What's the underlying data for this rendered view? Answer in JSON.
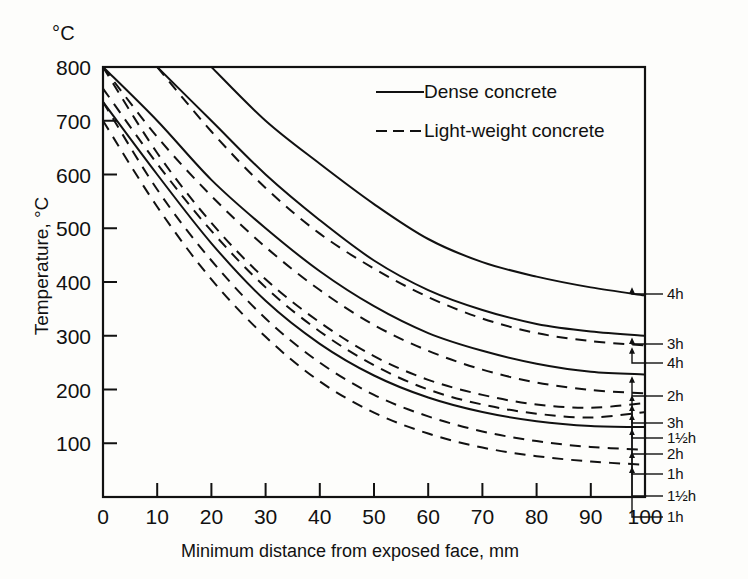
{
  "chart_data": {
    "type": "line",
    "title": "",
    "unit_label": "°C",
    "xlabel": "Minimum distance from exposed face, mm",
    "ylabel": "Temperature, °C",
    "xlim": [
      0,
      100
    ],
    "ylim": [
      0,
      800
    ],
    "xticks": [
      "0",
      "10",
      "20",
      "30",
      "40",
      "50",
      "60",
      "70",
      "80",
      "90",
      "100"
    ],
    "yticks": [
      "100",
      "200",
      "300",
      "400",
      "500",
      "600",
      "700",
      "800"
    ],
    "grid": false,
    "legend_position": "top-right-inside",
    "legend": [
      {
        "label": "Dense concrete",
        "style": "solid"
      },
      {
        "label": "Light-weight concrete",
        "style": "dashed"
      }
    ],
    "x": [
      0,
      10,
      20,
      30,
      40,
      50,
      60,
      70,
      80,
      90,
      100
    ],
    "series": [
      {
        "name": "Dense concrete 4h",
        "style": "solid",
        "end_label": "4h",
        "values": [
          null,
          null,
          800,
          700,
          620,
          545,
          480,
          437,
          410,
          390,
          375
        ]
      },
      {
        "name": "Dense concrete 3h",
        "style": "solid",
        "end_label": "3h",
        "values": [
          null,
          800,
          700,
          600,
          515,
          440,
          385,
          348,
          322,
          308,
          300
        ]
      },
      {
        "name": "Light-weight concrete 4h",
        "style": "dashed",
        "end_label": "4h",
        "values": [
          null,
          800,
          680,
          575,
          490,
          425,
          372,
          332,
          305,
          290,
          282
        ]
      },
      {
        "name": "Dense concrete 2h",
        "style": "solid",
        "end_label": "2h",
        "values": [
          800,
          700,
          590,
          500,
          420,
          355,
          305,
          272,
          248,
          233,
          228
        ]
      },
      {
        "name": "Light-weight concrete 3h",
        "style": "dashed",
        "end_label": "3h",
        "values": [
          800,
          670,
          560,
          465,
          385,
          320,
          272,
          237,
          213,
          199,
          193
        ]
      },
      {
        "name": "Light-weight concrete 1½h",
        "style": "dashed",
        "end_label": "1½h",
        "values": [
          800,
          640,
          510,
          405,
          325,
          262,
          218,
          190,
          172,
          166,
          175
        ]
      },
      {
        "name": "Light-weight concrete 2h",
        "style": "dashed",
        "end_label": "2h",
        "values": [
          760,
          620,
          495,
          390,
          308,
          245,
          200,
          172,
          155,
          148,
          158
        ]
      },
      {
        "name": "Dense concrete 1h",
        "style": "solid",
        "end_label": "1h",
        "values": [
          735,
          600,
          472,
          365,
          285,
          226,
          185,
          158,
          141,
          132,
          130
        ]
      },
      {
        "name": "Light-weight concrete 1½h b",
        "style": "dashed",
        "end_label": "1½h",
        "values": [
          735,
          572,
          440,
          332,
          250,
          190,
          150,
          122,
          104,
          93,
          88
        ]
      },
      {
        "name": "Light-weight concrete 1h",
        "style": "dashed",
        "end_label": "1h",
        "values": [
          700,
          540,
          405,
          298,
          215,
          157,
          118,
          92,
          76,
          66,
          60
        ]
      }
    ],
    "right_labels": [
      {
        "text": "4h",
        "value": 375
      },
      {
        "text": "3h",
        "value": 300
      },
      {
        "text": "4h",
        "value": 282
      },
      {
        "text": "2h",
        "value": 228
      },
      {
        "text": "3h",
        "value": 193
      },
      {
        "text": "1½h",
        "value": 175
      },
      {
        "text": "2h",
        "value": 158
      },
      {
        "text": "1h",
        "value": 130
      },
      {
        "text": "1½h",
        "value": 88
      },
      {
        "text": "1h",
        "value": 60
      }
    ]
  }
}
